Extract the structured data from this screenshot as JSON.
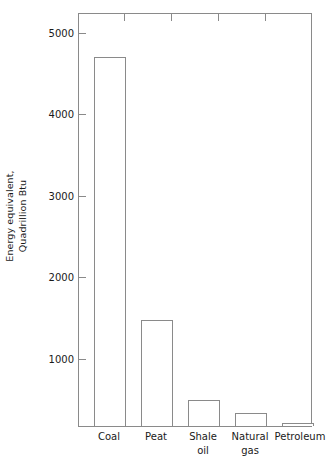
{
  "chart_data": {
    "type": "bar",
    "title": "",
    "xlabel": "",
    "ylabel": "Energy equivalent,\nQuadrillion Btu",
    "categories": [
      "Coal",
      "Peat",
      "Shale\noil",
      "Natural\ngas",
      "Petroleum"
    ],
    "values": [
      4760,
      1480,
      480,
      310,
      190
    ],
    "ylim": [
      150,
      5300
    ],
    "yticks": [
      1000,
      2000,
      3000,
      4000,
      5000
    ],
    "ytick_labels": [
      "1000",
      "2000",
      "3000",
      "4000",
      "5000"
    ],
    "grid": false,
    "legend": null,
    "bar_style": {
      "fill": "#ffffff",
      "edge": "#8a8a8a"
    },
    "axis_color": "#8a8a8a",
    "text_color": "#1a1a1a",
    "background": "#ffffff"
  }
}
